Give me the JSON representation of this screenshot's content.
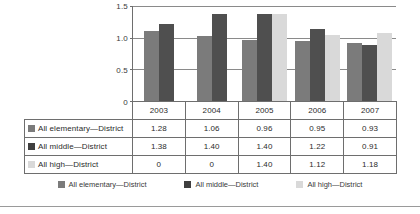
{
  "chart_data": {
    "type": "bar",
    "title": "",
    "xlabel": "",
    "ylabel": "",
    "categories": [
      "2003",
      "2004",
      "2005",
      "2006",
      "2007"
    ],
    "ylim": [
      0,
      1.5
    ],
    "yticks": [
      "0",
      "0.5",
      "1.0",
      "1.5"
    ],
    "ytick_values": [
      0,
      0.5,
      1.0,
      1.5
    ],
    "grid": true,
    "legend_position": "bottom",
    "series": [
      {
        "name": "All elementary—District",
        "color": "#7b7b7b",
        "values": [
          1.28,
          1.06,
          0.96,
          0.95,
          0.93
        ],
        "plotted_heights": [
          1.1,
          1.03,
          0.96,
          0.95,
          0.92
        ]
      },
      {
        "name": "All middle—District",
        "color": "#3f3f3f",
        "values": [
          1.38,
          1.4,
          1.4,
          1.22,
          0.91
        ],
        "plotted_heights": [
          1.22,
          1.38,
          1.38,
          1.14,
          0.88
        ]
      },
      {
        "name": "All high—District",
        "color": "#d9d9d9",
        "values": [
          0,
          0,
          1.4,
          1.12,
          1.18
        ],
        "plotted_heights": [
          0,
          0,
          1.38,
          1.05,
          1.08
        ]
      }
    ]
  },
  "table": {
    "header": [
      "",
      "2003",
      "2004",
      "2005",
      "2006",
      "2007"
    ],
    "rows": [
      {
        "label": "All elementary—District",
        "swatch": "#7b7b7b",
        "cells": [
          "1.28",
          "1.06",
          "0.96",
          "0.95",
          "0.93"
        ]
      },
      {
        "label": "All middle—District",
        "swatch": "#3f3f3f",
        "cells": [
          "1.38",
          "1.40",
          "1.40",
          "1.22",
          "0.91"
        ]
      },
      {
        "label": "All high—District",
        "swatch": "#d9d9d9",
        "cells": [
          "0",
          "0",
          "1.40",
          "1.12",
          "1.18"
        ]
      }
    ]
  },
  "legend": {
    "items": [
      {
        "label": "All elementary—District",
        "color": "#7b7b7b"
      },
      {
        "label": "All middle—District",
        "color": "#3f3f3f"
      },
      {
        "label": "All high—District",
        "color": "#d9d9d9"
      }
    ]
  }
}
